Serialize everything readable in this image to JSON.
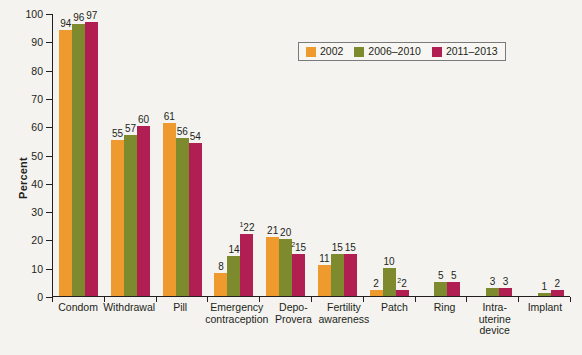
{
  "chart_data": {
    "type": "bar",
    "title": "",
    "xlabel": "",
    "ylabel": "Percent",
    "ylim": [
      0,
      100
    ],
    "ytick_step": 10,
    "yticks": [
      0,
      10,
      20,
      30,
      40,
      50,
      60,
      70,
      80,
      90,
      100
    ],
    "grid": false,
    "legend_position": "top-right",
    "categories": [
      "Condom",
      "Withdrawal",
      "Pill",
      "Emergency\ncontraception",
      "Depo-\nProvera",
      "Fertility\nawareness",
      "Patch",
      "Ring",
      "Intra-\nuterine\ndevice",
      "Implant"
    ],
    "series": [
      {
        "name": "2002",
        "color": "#ef9a2e",
        "values": [
          94,
          55,
          61,
          8,
          21,
          11,
          2,
          null,
          null,
          null
        ],
        "labels": [
          "94",
          "55",
          "61",
          "8",
          "21",
          "11",
          "2",
          "",
          "",
          ""
        ]
      },
      {
        "name": "2006–2010",
        "color": "#7d8a2e",
        "values": [
          96,
          57,
          56,
          14,
          20,
          15,
          10,
          5,
          3,
          1
        ],
        "labels": [
          "96",
          "57",
          "56",
          "14",
          "20",
          "15",
          "10",
          "5",
          "3",
          "1"
        ]
      },
      {
        "name": "2011–2013",
        "color": "#b01e52",
        "values": [
          97,
          60,
          54,
          22,
          15,
          15,
          2,
          5,
          3,
          2
        ],
        "labels": [
          "97",
          "60",
          "54",
          "22",
          "15",
          "15",
          "2",
          "5",
          "3",
          "2"
        ],
        "label_footnotes": [
          "",
          "",
          "",
          "1",
          "2",
          "",
          "2",
          "",
          "",
          ""
        ]
      }
    ]
  },
  "legend": {
    "items": [
      {
        "label": "2002",
        "color": "#ef9a2e"
      },
      {
        "label": "2006–2010",
        "color": "#7d8a2e"
      },
      {
        "label": "2011–2013",
        "color": "#b01e52"
      }
    ]
  },
  "colors": {
    "background": "#f4f3ef",
    "axis": "#231f20",
    "series_2002": "#ef9a2e",
    "series_2006_2010": "#7d8a2e",
    "series_2011_2013": "#b01e52"
  }
}
